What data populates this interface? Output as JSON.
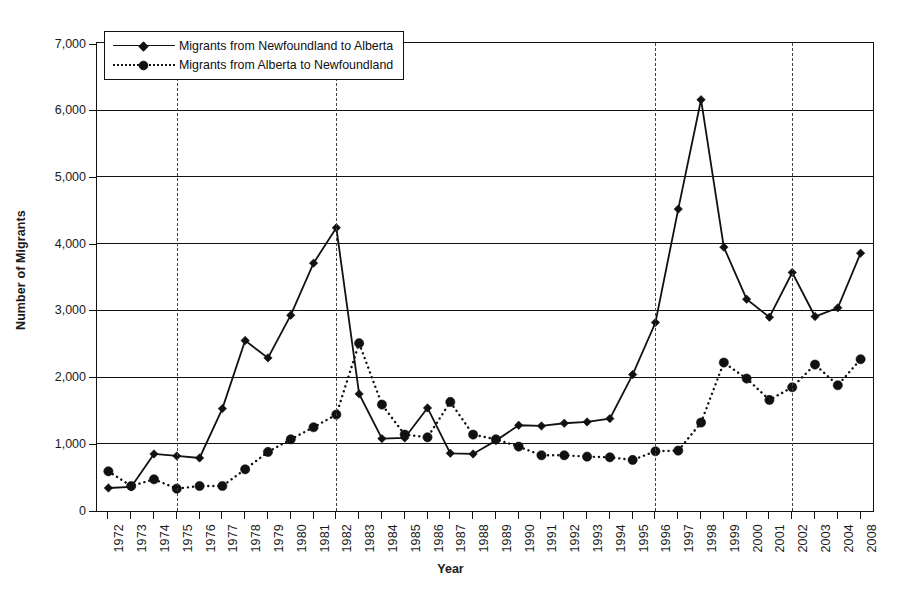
{
  "chart_data": {
    "type": "line",
    "title": "",
    "xlabel": "Year",
    "ylabel": "Number of Migrants",
    "grid": true,
    "legend_position": "top-left",
    "ylim": [
      0,
      7000
    ],
    "yticks": [
      "0",
      "1,000",
      "2,000",
      "3,000",
      "4,000",
      "5,000",
      "6,000",
      "7,000"
    ],
    "ytick_values": [
      0,
      1000,
      2000,
      3000,
      4000,
      5000,
      6000,
      7000
    ],
    "categories": [
      "1972",
      "1973",
      "1974",
      "1975",
      "1976",
      "1977",
      "1978",
      "1979",
      "1980",
      "1981",
      "1982",
      "1983",
      "1984",
      "1985",
      "1986",
      "1987",
      "1988",
      "1989",
      "1990",
      "1991",
      "1992",
      "1993",
      "1994",
      "1995",
      "1996",
      "1997",
      "1998",
      "1999",
      "2000",
      "2001",
      "2002",
      "2003",
      "2004",
      "2008"
    ],
    "reference_lines": [
      "1975",
      "1982",
      "1996",
      "2002"
    ],
    "series": [
      {
        "name": "Migrants from Newfoundland to Alberta",
        "style": "solid",
        "marker": "diamond",
        "color": "#111111",
        "values": [
          330,
          345,
          840,
          810,
          780,
          1520,
          2540,
          2280,
          2920,
          3700,
          4230,
          1740,
          1070,
          1080,
          1530,
          850,
          840,
          1040,
          1270,
          1260,
          1300,
          1320,
          1370,
          2030,
          2810,
          4510,
          6150,
          3940,
          3160,
          2890,
          3560,
          2900,
          3030,
          3850
        ]
      },
      {
        "name": "Migrants from Alberta to Newfoundland",
        "style": "dashed",
        "marker": "circle",
        "color": "#111111",
        "values": [
          580,
          360,
          460,
          320,
          360,
          360,
          610,
          870,
          1060,
          1240,
          1430,
          2500,
          1580,
          1130,
          1090,
          1620,
          1130,
          1060,
          950,
          820,
          820,
          800,
          790,
          750,
          880,
          890,
          1310,
          2210,
          1970,
          1650,
          1840,
          2180,
          1870,
          2260
        ]
      }
    ]
  },
  "legend": {
    "items": [
      {
        "label": "Migrants from Newfoundland to Alberta",
        "style": "solid",
        "marker": "diamond"
      },
      {
        "label": "Migrants from Alberta to Newfoundland",
        "style": "dashed",
        "marker": "circle"
      }
    ]
  }
}
